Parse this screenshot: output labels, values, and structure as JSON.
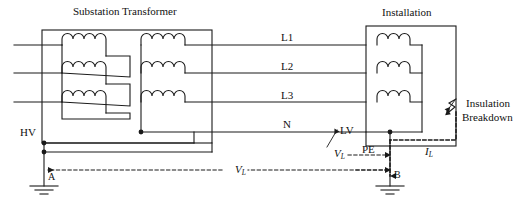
{
  "figure": {
    "type": "electrical-schematic",
    "stroke_color": "#1a1a1a",
    "text_color": "#111111",
    "background_color": "#ffffff",
    "width": 517,
    "height": 213
  },
  "titles": {
    "transformer": "Substation Transformer",
    "installation": "Installation"
  },
  "conductors": [
    {
      "name": "L1",
      "label": "L1",
      "y": 45
    },
    {
      "name": "L2",
      "label": "L2",
      "y": 73
    },
    {
      "name": "L3",
      "label": "L3",
      "y": 102
    },
    {
      "name": "N",
      "label": "N",
      "y": 132
    }
  ],
  "labels": {
    "hv": "HV",
    "lv": "LV",
    "pe": "PE",
    "point_a": "A",
    "point_b": "B",
    "insulation_breakdown_line1": "Insulation",
    "insulation_breakdown_line2": "Breakdown"
  },
  "quantities": [
    {
      "name": "touch-voltage-lv",
      "symbol": "V",
      "subscript": "L",
      "x": 334,
      "y": 152
    },
    {
      "name": "loop-voltage",
      "symbol": "V",
      "subscript": "L",
      "x": 235,
      "y": 176
    },
    {
      "name": "fault-current",
      "symbol": "I",
      "subscript": "L",
      "x": 425,
      "y": 152
    }
  ],
  "windings": {
    "primary": {
      "configuration": "delta",
      "count": 3
    },
    "secondary": {
      "configuration": "wye",
      "count": 3
    },
    "installation_loads": {
      "configuration": "load-coils",
      "count": 3
    }
  },
  "earth_electrodes": [
    {
      "name": "electrode-a",
      "label": "A",
      "x": 44,
      "y": 184
    },
    {
      "name": "electrode-b",
      "label": "B",
      "x": 390,
      "y": 184
    }
  ]
}
